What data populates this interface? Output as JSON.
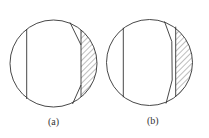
{
  "figure": {
    "panels": [
      {
        "label": "(a)",
        "description": "Circle with vertical chord on left, hatched circular segment on right bounded by vertical chord, slanted lines at top and bottom"
      },
      {
        "label": "(b)",
        "description": "Circle with vertical chord on left, hatched circular segment on right bounded by vertical chord, bent line alongside chord"
      }
    ],
    "colors": {
      "stroke": "#333333",
      "background": "#ffffff"
    }
  }
}
